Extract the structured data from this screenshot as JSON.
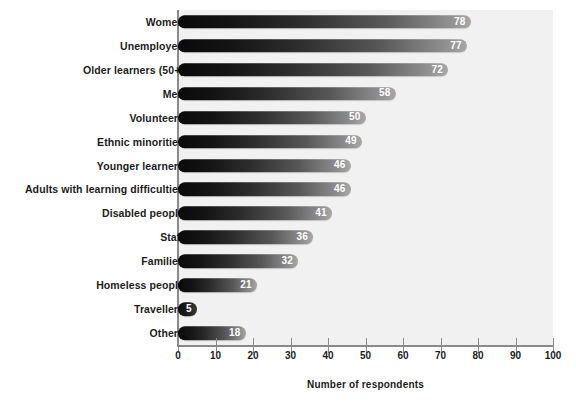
{
  "chart_data": {
    "type": "bar",
    "orientation": "horizontal",
    "title": "",
    "xlabel": "Number of respondents",
    "ylabel": "",
    "xlim": [
      0,
      100
    ],
    "xticks": [
      0,
      10,
      20,
      30,
      40,
      50,
      60,
      70,
      80,
      90,
      100
    ],
    "grid": false,
    "legend": null,
    "categories": [
      "Women",
      "Unemployed",
      "Older learners (50+)",
      "Men",
      "Volunteers",
      "Ethnic minorities",
      "Younger learners",
      "Adults with learning difficulties",
      "Disabled people",
      "Staff",
      "Families",
      "Homeless people",
      "Travellers",
      "Others"
    ],
    "values": [
      78,
      77,
      72,
      58,
      50,
      49,
      46,
      46,
      41,
      36,
      32,
      21,
      5,
      18
    ],
    "value_labels": [
      "78",
      "77",
      "72",
      "58",
      "50",
      "49",
      "46",
      "46",
      "41",
      "36",
      "32",
      "21",
      "5",
      "18"
    ],
    "colors": {
      "bar_gradient_start": "#0a0a0a",
      "bar_gradient_end": "#a8a8a8",
      "plot_background": "#f1f1f1",
      "page_background": "#ffffff",
      "axis_line": "#8a8a8a",
      "text": "#1c1c1c",
      "value_label_text": "#ffffff"
    }
  },
  "axis": {
    "tick_labels": [
      "0",
      "10",
      "20",
      "30",
      "40",
      "50",
      "60",
      "70",
      "80",
      "90",
      "100"
    ],
    "title": "Number of respondents"
  }
}
